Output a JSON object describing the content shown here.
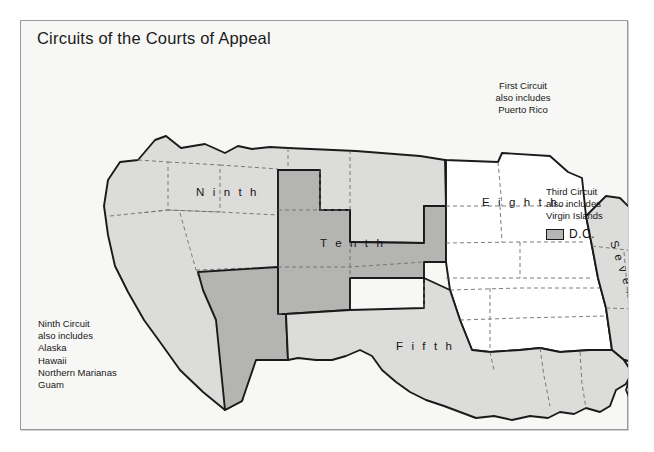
{
  "map": {
    "title": "Circuits of the Courts of Appeal",
    "circuits": [
      {
        "id": "first",
        "label": "First",
        "shade": "light"
      },
      {
        "id": "second",
        "label": "Second",
        "shade": "medium"
      },
      {
        "id": "third",
        "label": "Third",
        "shade": "white"
      },
      {
        "id": "fourth",
        "label": "Fourth",
        "shade": "light"
      },
      {
        "id": "fifth",
        "label": "Fifth",
        "shade": "light"
      },
      {
        "id": "sixth",
        "label": "Sixth",
        "shade": "medium"
      },
      {
        "id": "seventh",
        "label": "Seventh",
        "shade": "light"
      },
      {
        "id": "eighth",
        "label": "Eighth",
        "shade": "white"
      },
      {
        "id": "ninth",
        "label": "Ninth",
        "shade": "light"
      },
      {
        "id": "tenth",
        "label": "Tenth",
        "shade": "medium"
      },
      {
        "id": "eleventh",
        "label": "Eleventh",
        "shade": "white"
      }
    ],
    "notes": {
      "first": "First Circuit\nalso includes\nPuerto Rico",
      "third": "Third Circuit\nalso includes\nVirgin Islands",
      "ninth": "Ninth Circuit\nalso includes\nAlaska\nHawaii\nNorthern Marianas\nGuam"
    },
    "legend": {
      "dc_label": "D.C."
    },
    "colors": {
      "shade_white": "#ffffff",
      "shade_light": "#dcdcda",
      "shade_medium": "#b4b4b2",
      "outline": "#1a1a1a",
      "state_line": "#6e6e6e",
      "background": "#f7f7f5",
      "frame": "#9a9a9a",
      "text": "#171717"
    }
  }
}
